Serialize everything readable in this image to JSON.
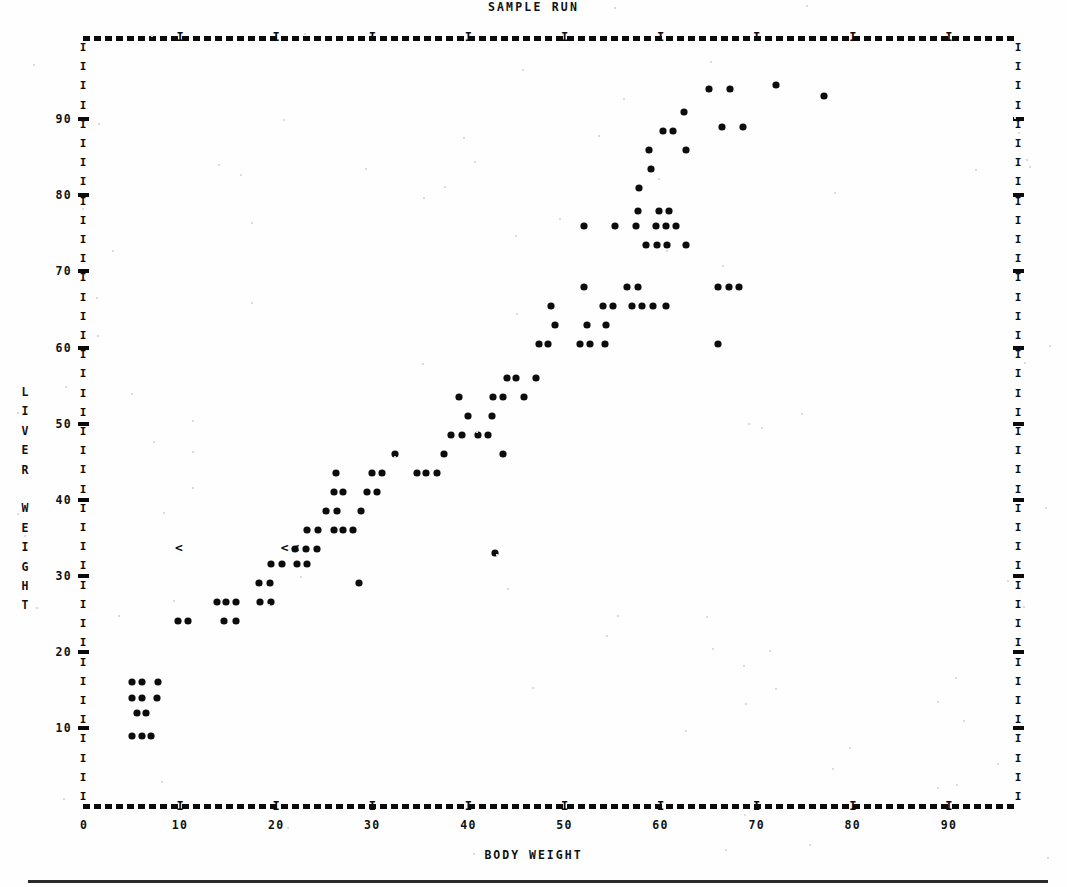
{
  "chart_data": {
    "type": "scatter",
    "title": "SAMPLE RUN",
    "xlabel": "BODY WEIGHT",
    "ylabel": "LIVER WEIGHT",
    "xlim": [
      0,
      97
    ],
    "ylim": [
      0,
      100
    ],
    "xticks": [
      0,
      10,
      20,
      30,
      40,
      50,
      60,
      70,
      80,
      90
    ],
    "yticks": [
      10,
      20,
      30,
      40,
      50,
      60,
      70,
      80,
      90
    ],
    "xtick_labels": [
      "0",
      "10",
      "20",
      "30",
      "40",
      "50",
      "60",
      "70",
      "80",
      "90"
    ],
    "ytick_labels": [
      "10",
      "20",
      "30",
      "40",
      "50",
      "60",
      "70",
      "80",
      "90"
    ],
    "grid": false,
    "legend": null,
    "marker_glyph": "*",
    "overlap_glyph": "<",
    "points": [
      [
        5,
        9
      ],
      [
        6,
        9
      ],
      [
        7,
        9
      ],
      [
        5.5,
        12
      ],
      [
        6.5,
        12
      ],
      [
        5,
        14
      ],
      [
        6,
        14
      ],
      [
        7.6,
        14
      ],
      [
        5,
        16
      ],
      [
        6,
        16
      ],
      [
        7.7,
        16
      ],
      [
        9.8,
        24
      ],
      [
        10.8,
        24
      ],
      [
        14.6,
        24
      ],
      [
        15.8,
        24
      ],
      [
        13.8,
        26.5
      ],
      [
        14.8,
        26.5
      ],
      [
        15.8,
        26.5
      ],
      [
        18.3,
        26.5
      ],
      [
        19.5,
        26.5
      ],
      [
        18.2,
        29
      ],
      [
        19.4,
        29
      ],
      [
        19.5,
        31.5
      ],
      [
        20.6,
        31.5
      ],
      [
        22.2,
        31.5
      ],
      [
        23.2,
        31.5
      ],
      [
        22.0,
        33.5
      ],
      [
        23.1,
        33.5
      ],
      [
        24.2,
        33.5
      ],
      [
        23.2,
        36
      ],
      [
        24.3,
        36
      ],
      [
        26.0,
        36
      ],
      [
        27.0,
        36
      ],
      [
        28.0,
        36
      ],
      [
        25.2,
        38.5
      ],
      [
        26.3,
        38.5
      ],
      [
        28.8,
        38.5
      ],
      [
        26.0,
        41
      ],
      [
        27.0,
        41
      ],
      [
        29.5,
        41
      ],
      [
        30.5,
        41
      ],
      [
        26.2,
        43.5
      ],
      [
        30.0,
        43.5
      ],
      [
        31.0,
        43.5
      ],
      [
        32.4,
        46
      ],
      [
        34.6,
        43.5
      ],
      [
        35.6,
        43.5
      ],
      [
        36.7,
        43.5
      ],
      [
        37.5,
        46
      ],
      [
        38.2,
        48.5
      ],
      [
        39.3,
        48.5
      ],
      [
        41.0,
        48.5
      ],
      [
        42.0,
        48.5
      ],
      [
        40.0,
        51
      ],
      [
        42.5,
        51
      ],
      [
        39.0,
        53.5
      ],
      [
        42.6,
        53.5
      ],
      [
        43.6,
        53.5
      ],
      [
        45.8,
        53.5
      ],
      [
        44.0,
        56
      ],
      [
        45.0,
        56
      ],
      [
        47.0,
        56
      ],
      [
        43.6,
        46
      ],
      [
        42.8,
        33
      ],
      [
        28.6,
        29
      ],
      [
        47.3,
        60.5
      ],
      [
        48.3,
        60.5
      ],
      [
        51.6,
        60.5
      ],
      [
        52.7,
        60.5
      ],
      [
        54.2,
        60.5
      ],
      [
        49.0,
        63
      ],
      [
        52.3,
        63
      ],
      [
        54.3,
        63
      ],
      [
        48.6,
        65.5
      ],
      [
        52.0,
        68
      ],
      [
        54.0,
        65.5
      ],
      [
        55.0,
        65.5
      ],
      [
        56.5,
        68
      ],
      [
        57.6,
        68
      ],
      [
        57.0,
        65.5
      ],
      [
        58.1,
        65.5
      ],
      [
        59.2,
        65.5
      ],
      [
        60.6,
        65.5
      ],
      [
        66.0,
        68
      ],
      [
        67.1,
        68
      ],
      [
        68.2,
        68
      ],
      [
        66.0,
        60.5
      ],
      [
        52.0,
        76
      ],
      [
        55.3,
        76
      ],
      [
        57.4,
        76
      ],
      [
        59.5,
        76
      ],
      [
        60.6,
        76
      ],
      [
        61.6,
        76
      ],
      [
        58.5,
        73.5
      ],
      [
        59.6,
        73.5
      ],
      [
        60.7,
        73.5
      ],
      [
        57.6,
        78
      ],
      [
        59.8,
        78
      ],
      [
        60.9,
        78
      ],
      [
        62.6,
        73.5
      ],
      [
        57.8,
        81
      ],
      [
        59.0,
        83.5
      ],
      [
        58.8,
        86
      ],
      [
        62.6,
        86
      ],
      [
        60.2,
        88.5
      ],
      [
        61.3,
        88.5
      ],
      [
        62.4,
        91
      ],
      [
        66.4,
        89
      ],
      [
        68.6,
        89
      ],
      [
        65.0,
        94
      ],
      [
        67.2,
        94
      ],
      [
        72.0,
        94.5
      ],
      [
        77.0,
        93
      ]
    ],
    "overlap_markers": [
      [
        10.0,
        33.5
      ],
      [
        21.0,
        33.5
      ],
      [
        22.1,
        33.5
      ]
    ],
    "n_points": 110
  },
  "header": {
    "title": "SAMPLE RUN"
  },
  "axes": {
    "x_title": "BODY WEIGHT",
    "y_title_chars": [
      "L",
      "I",
      "V",
      "E",
      "R",
      "",
      "W",
      "E",
      "I",
      "G",
      "H",
      "T"
    ]
  },
  "glyphs": {
    "vertical_axis_char": "I",
    "vertical_tick_char": "-",
    "horizontal_tick_char": "I"
  }
}
